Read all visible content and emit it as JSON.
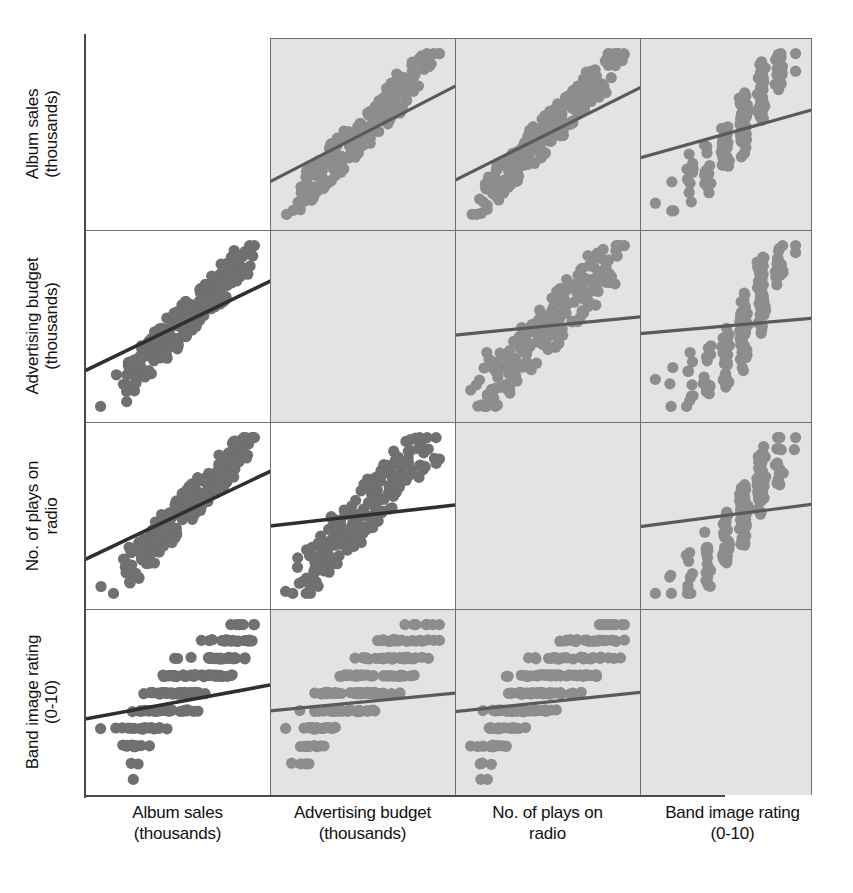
{
  "figure": {
    "type": "scatterplot-matrix",
    "variables": [
      {
        "key": "album_sales",
        "line1": "Album sales",
        "line2": "(thousands)"
      },
      {
        "key": "advertising",
        "line1": "Advertising budget",
        "line2": "(thousands)"
      },
      {
        "key": "radio_plays",
        "line1": "No. of plays on",
        "line2": "radio"
      },
      {
        "key": "band_image",
        "line1": "Band image rating",
        "line2": "(0-10)"
      }
    ],
    "colors": {
      "panel_white": "#ffffff",
      "panel_shaded": "#e3e3e3",
      "grid_line": "#6f6f6f",
      "axis_line": "#4a4a4a",
      "point_on_white": "#707070",
      "point_on_shaded": "#8d8d8d",
      "fit_line_on_white": "#2f2f2f",
      "fit_line_on_shaded": "#5a5a5a",
      "text": "#111111"
    },
    "notes": {
      "diagonal": "empty",
      "fit_line": "linear regression overlay in every off-diagonal panel",
      "axis_ticks": "none shown",
      "gridlines": "panel borders only"
    }
  },
  "chart_data": {
    "type": "scatter",
    "title": "",
    "xlabel": "",
    "ylabel": "",
    "layout": "4x4 scatterplot matrix, diagonal blank",
    "variables": [
      "Album sales (thousands)",
      "Advertising budget (thousands)",
      "No. of plays on radio",
      "Band image rating (0-10)"
    ],
    "row_labels": [
      "Album sales (thousands)",
      "Advertising budget (thousands)",
      "No. of plays on radio",
      "Band image rating (0-10)"
    ],
    "column_labels": [
      "Album sales (thousands)",
      "Advertising budget (thousands)",
      "No. of plays on radio",
      "Band image rating (0-10)"
    ],
    "legend": [],
    "grid": false,
    "panels": [
      {
        "row": 0,
        "col": 0,
        "x": "Album sales (thousands)",
        "y": "Album sales (thousands)",
        "shaded": false,
        "blank": true,
        "trend": null
      },
      {
        "row": 0,
        "col": 1,
        "x": "Advertising budget (thousands)",
        "y": "Album sales (thousands)",
        "shaded": true,
        "blank": false,
        "trend": "positive-strong"
      },
      {
        "row": 0,
        "col": 2,
        "x": "No. of plays on radio",
        "y": "Album sales (thousands)",
        "shaded": true,
        "blank": false,
        "trend": "positive-strong"
      },
      {
        "row": 0,
        "col": 3,
        "x": "Band image rating (0-10)",
        "y": "Album sales (thousands)",
        "shaded": true,
        "blank": false,
        "trend": "positive-weak"
      },
      {
        "row": 1,
        "col": 0,
        "x": "Album sales (thousands)",
        "y": "Advertising budget (thousands)",
        "shaded": false,
        "blank": false,
        "trend": "positive-strong"
      },
      {
        "row": 1,
        "col": 1,
        "x": "Advertising budget (thousands)",
        "y": "Advertising budget (thousands)",
        "shaded": true,
        "blank": true,
        "trend": null
      },
      {
        "row": 1,
        "col": 2,
        "x": "No. of plays on radio",
        "y": "Advertising budget (thousands)",
        "shaded": true,
        "blank": false,
        "trend": "positive-weak"
      },
      {
        "row": 1,
        "col": 3,
        "x": "Band image rating (0-10)",
        "y": "Advertising budget (thousands)",
        "shaded": true,
        "blank": false,
        "trend": "positive-weak"
      },
      {
        "row": 2,
        "col": 0,
        "x": "Album sales (thousands)",
        "y": "No. of plays on radio",
        "shaded": false,
        "blank": false,
        "trend": "positive-strong"
      },
      {
        "row": 2,
        "col": 1,
        "x": "Advertising budget (thousands)",
        "y": "No. of plays on radio",
        "shaded": false,
        "blank": false,
        "trend": "positive-weak"
      },
      {
        "row": 2,
        "col": 2,
        "x": "No. of plays on radio",
        "y": "No. of plays on radio",
        "shaded": true,
        "blank": true,
        "trend": null
      },
      {
        "row": 2,
        "col": 3,
        "x": "Band image rating (0-10)",
        "y": "No. of plays on radio",
        "shaded": true,
        "blank": false,
        "trend": "positive-weak"
      },
      {
        "row": 3,
        "col": 0,
        "x": "Album sales (thousands)",
        "y": "Band image rating (0-10)",
        "shaded": false,
        "blank": false,
        "trend": "positive-weak"
      },
      {
        "row": 3,
        "col": 1,
        "x": "Advertising budget (thousands)",
        "y": "Band image rating (0-10)",
        "shaded": true,
        "blank": false,
        "trend": "positive-weak"
      },
      {
        "row": 3,
        "col": 2,
        "x": "No. of plays on radio",
        "y": "Band image rating (0-10)",
        "shaded": true,
        "blank": false,
        "trend": "positive-weak"
      },
      {
        "row": 3,
        "col": 3,
        "x": "Band image rating (0-10)",
        "y": "Band image rating (0-10)",
        "shaded": true,
        "blank": true,
        "trend": null
      }
    ],
    "n_points": 200,
    "points": {
      "album_sales": [
        12,
        38,
        52,
        25,
        42,
        66,
        31,
        47,
        58,
        19,
        73,
        44,
        29,
        61,
        35,
        50,
        22,
        68,
        40,
        56,
        33,
        48,
        64,
        27,
        43,
        59,
        36,
        71,
        45,
        30,
        54,
        39,
        62,
        24,
        49,
        67,
        41,
        57,
        34,
        51,
        70,
        26,
        46,
        60,
        37,
        53,
        28,
        65,
        42,
        55,
        32,
        69,
        44,
        38,
        58,
        23,
        47,
        63,
        36,
        50,
        74,
        29,
        43,
        61,
        35,
        52,
        40,
        66,
        27,
        48,
        57,
        31,
        45,
        62,
        39,
        54,
        22,
        68,
        44,
        36,
        59,
        33,
        50,
        65,
        28,
        47,
        41,
        70,
        38,
        53,
        25,
        61,
        46,
        34,
        56,
        43,
        60,
        30,
        49,
        64,
        37,
        51,
        26,
        67,
        42,
        55,
        32,
        58,
        45,
        39,
        71,
        29,
        48,
        62,
        35,
        52,
        40,
        66,
        24,
        47,
        57,
        44,
        36,
        60,
        33,
        50,
        69,
        27,
        43,
        61,
        38,
        54,
        23,
        65,
        46,
        31,
        49,
        58,
        42,
        36,
        72,
        28,
        45,
        63,
        34,
        51,
        40,
        67,
        26,
        48,
        55,
        39,
        44,
        60,
        37,
        53,
        29,
        68,
        43,
        35,
        57,
        32,
        50,
        64,
        41,
        46,
        25,
        62,
        47,
        38,
        59,
        30,
        52,
        66,
        36,
        49,
        27,
        61,
        44,
        40,
        58,
        33,
        54,
        70,
        31,
        47,
        42,
        63,
        28,
        51,
        45,
        37,
        56,
        24,
        60,
        48,
        34,
        65,
        39
      ],
      "advertising": [
        10,
        35,
        58,
        22,
        41,
        72,
        28,
        49,
        63,
        15,
        84,
        46,
        26,
        67,
        33,
        54,
        18,
        76,
        38,
        60,
        30,
        50,
        70,
        23,
        44,
        62,
        34,
        80,
        47,
        27,
        57,
        36,
        68,
        20,
        52,
        74,
        42,
        59,
        31,
        53,
        78,
        24,
        48,
        64,
        35,
        55,
        25,
        71,
        43,
        57,
        29,
        77,
        45,
        37,
        61,
        19,
        50,
        66,
        33,
        52,
        82,
        26,
        44,
        65,
        32,
        54,
        39,
        73,
        23,
        49,
        60,
        28,
        46,
        66,
        36,
        56,
        17,
        75,
        45,
        33,
        62,
        30,
        51,
        69,
        25,
        48,
        40,
        79,
        37,
        55,
        21,
        64,
        47,
        31,
        58,
        42,
        63,
        27,
        50,
        68,
        34,
        53,
        22,
        72,
        43,
        57,
        29,
        61,
        46,
        38,
        81,
        26,
        49,
        65,
        32,
        54,
        41,
        70,
        20,
        48,
        60,
        45,
        33,
        63,
        30,
        52,
        74,
        24,
        44,
        64,
        37,
        56,
        18,
        69,
        47,
        28,
        50,
        61,
        43,
        33,
        85,
        25,
        46,
        67,
        31,
        53,
        39,
        71,
        23,
        49,
        58,
        36,
        45,
        63,
        34,
        55,
        26,
        73,
        44,
        32,
        60,
        29,
        51,
        67,
        42,
        47,
        21,
        65,
        48,
        35,
        62,
        27,
        53,
        70,
        33,
        50,
        24,
        64,
        45,
        39,
        61,
        30,
        56,
        75,
        28,
        48,
        43,
        66,
        25,
        52,
        46,
        34,
        59,
        20,
        63,
        49,
        31,
        68,
        36
      ],
      "radio_plays": [
        14,
        30,
        42,
        21,
        33,
        52,
        25,
        38,
        46,
        17,
        58,
        36,
        23,
        48,
        28,
        40,
        19,
        54,
        32,
        44,
        27,
        39,
        50,
        22,
        35,
        47,
        29,
        56,
        37,
        24,
        43,
        31,
        49,
        20,
        40,
        53,
        33,
        45,
        28,
        41,
        55,
        21,
        37,
        47,
        30,
        42,
        23,
        51,
        34,
        44,
        26,
        55,
        36,
        31,
        46,
        18,
        38,
        50,
        29,
        40,
        59,
        22,
        35,
        48,
        28,
        41,
        32,
        52,
        20,
        38,
        45,
        25,
        36,
        49,
        31,
        43,
        17,
        54,
        35,
        29,
        47,
        26,
        40,
        51,
        21,
        38,
        33,
        56,
        30,
        44,
        19,
        48,
        37,
        27,
        45,
        34,
        47,
        24,
        39,
        50,
        30,
        41,
        20,
        53,
        34,
        44,
        26,
        46,
        36,
        31,
        57,
        22,
        38,
        49,
        28,
        41,
        32,
        52,
        19,
        38,
        45,
        35,
        29,
        47,
        26,
        40,
        55,
        21,
        35,
        48,
        30,
        43,
        18,
        51,
        37,
        24,
        39,
        46,
        34,
        29,
        58,
        22,
        36,
        50,
        27,
        41,
        32,
        53,
        20,
        38,
        44,
        31,
        35,
        47,
        29,
        42,
        23,
        54,
        34,
        28,
        45,
        25,
        40,
        50,
        33,
        37,
        18,
        49,
        38,
        30,
        46,
        22,
        41,
        52,
        29,
        39,
        21,
        48,
        35,
        32,
        46,
        26,
        42,
        56,
        23,
        38,
        34,
        50,
        20,
        40,
        36,
        30,
        44,
        19,
        47,
        39,
        27,
        53,
        31
      ],
      "band_image": [
        3,
        5,
        7,
        4,
        6,
        8,
        5,
        6,
        7,
        3,
        8,
        6,
        5,
        7,
        6,
        7,
        4,
        8,
        6,
        7,
        5,
        6,
        7,
        4,
        6,
        7,
        5,
        8,
        6,
        5,
        7,
        6,
        7,
        4,
        6,
        8,
        6,
        7,
        5,
        6,
        8,
        4,
        6,
        7,
        5,
        7,
        4,
        7,
        6,
        7,
        5,
        8,
        6,
        6,
        7,
        3,
        6,
        7,
        5,
        6,
        9,
        4,
        6,
        7,
        5,
        7,
        6,
        8,
        4,
        6,
        7,
        5,
        6,
        7,
        6,
        7,
        2,
        8,
        6,
        5,
        7,
        5,
        6,
        7,
        4,
        6,
        6,
        8,
        6,
        7,
        3,
        7,
        6,
        5,
        7,
        6,
        7,
        4,
        6,
        7,
        5,
        6,
        3,
        8,
        6,
        7,
        5,
        7,
        6,
        6,
        8,
        4,
        6,
        7,
        5,
        7,
        6,
        8,
        3,
        6,
        7,
        6,
        5,
        7,
        5,
        6,
        8,
        4,
        6,
        7,
        6,
        7,
        2,
        7,
        6,
        5,
        6,
        7,
        6,
        5,
        9,
        4,
        6,
        7,
        5,
        6,
        6,
        8,
        3,
        6,
        7,
        5,
        6,
        7,
        5,
        7,
        4,
        8,
        6,
        5,
        7,
        5,
        6,
        7,
        6,
        6,
        1,
        7,
        6,
        6,
        7,
        4,
        6,
        8,
        5,
        6,
        3,
        7,
        6,
        6,
        7,
        5,
        7,
        8,
        4,
        6,
        6,
        7,
        3,
        6,
        6,
        5,
        7,
        2,
        7,
        6,
        5,
        8,
        6
      ]
    },
    "trend_lines": [
      {
        "row": 0,
        "col": 1,
        "slope": 0.62
      },
      {
        "row": 0,
        "col": 2,
        "slope": 0.6
      },
      {
        "row": 0,
        "col": 3,
        "slope": 0.31
      },
      {
        "row": 1,
        "col": 0,
        "slope": 0.58
      },
      {
        "row": 1,
        "col": 2,
        "slope": 0.12
      },
      {
        "row": 1,
        "col": 3,
        "slope": 0.1
      },
      {
        "row": 2,
        "col": 0,
        "slope": 0.59
      },
      {
        "row": 2,
        "col": 1,
        "slope": 0.14
      },
      {
        "row": 2,
        "col": 3,
        "slope": 0.15
      },
      {
        "row": 3,
        "col": 0,
        "slope": 0.23
      },
      {
        "row": 3,
        "col": 1,
        "slope": 0.12
      },
      {
        "row": 3,
        "col": 2,
        "slope": 0.13
      }
    ]
  }
}
